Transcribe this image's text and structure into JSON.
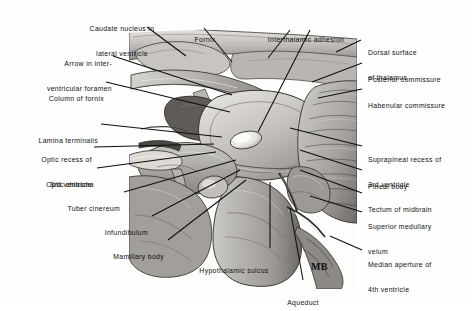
{
  "figure": {
    "signature": "MB",
    "type": "grayscale anatomical illustration",
    "colors": {
      "ink": "#101010",
      "leader_line": "#0d0d0d",
      "page_background": "#fefefe",
      "tissue_light": "#d8d6d2",
      "tissue_mid": "#a9a6a2",
      "tissue_dark": "#6f6c69",
      "tissue_shadow": "#403e3c",
      "highlight": "#f2f1ee"
    }
  },
  "labels": {
    "top": [
      {
        "id": "caudate-nucleus",
        "lines": [
          "Caudate nucleus in",
          "lateral ventricle"
        ]
      },
      {
        "id": "fornix",
        "lines": [
          "Fornix"
        ]
      },
      {
        "id": "interthalamic-adhesion",
        "lines": [
          "Interthalamic adhesion"
        ]
      }
    ],
    "left": [
      {
        "id": "arrow-interventricular-foramen",
        "lines": [
          "Arrow in inter-",
          "ventricular foramen"
        ]
      },
      {
        "id": "column-of-fornix",
        "lines": [
          "Column of fornix"
        ]
      },
      {
        "id": "lamina-terminalis",
        "lines": [
          "Lamina terminalis"
        ]
      },
      {
        "id": "optic-recess",
        "lines": [
          "Optic recess of",
          "3rd ventricle"
        ]
      },
      {
        "id": "optic-chiasma",
        "lines": [
          "Optic chiasma"
        ]
      },
      {
        "id": "tuber-cinereum",
        "lines": [
          "Tuber cinereum"
        ]
      },
      {
        "id": "infundibulum",
        "lines": [
          "Infundibulum"
        ]
      },
      {
        "id": "mamillary-body",
        "lines": [
          "Mamillary body"
        ]
      }
    ],
    "right": [
      {
        "id": "dorsal-surface-thalamus",
        "lines": [
          "Dorsal surface",
          "of thalamus"
        ]
      },
      {
        "id": "posterior-commissure",
        "lines": [
          "Posterior commissure"
        ]
      },
      {
        "id": "habenular-commissure",
        "lines": [
          "Habenular commissure"
        ]
      },
      {
        "id": "suprapineal-recess",
        "lines": [
          "Suprapineal recess of",
          "3rd ventricle"
        ]
      },
      {
        "id": "pineal-body",
        "lines": [
          "Pineal body"
        ]
      },
      {
        "id": "tectum-of-midbrain",
        "lines": [
          "Tectum of midbrain"
        ]
      },
      {
        "id": "superior-medullary-velum",
        "lines": [
          "Superior medullary",
          "velum"
        ]
      },
      {
        "id": "median-aperture",
        "lines": [
          "Median aperture of",
          "4th ventricle"
        ]
      }
    ],
    "bottom": [
      {
        "id": "hypothalamic-sulcus",
        "lines": [
          "Hypothalamic sulcus"
        ]
      },
      {
        "id": "aqueduct",
        "lines": [
          "Aqueduct"
        ]
      }
    ]
  }
}
